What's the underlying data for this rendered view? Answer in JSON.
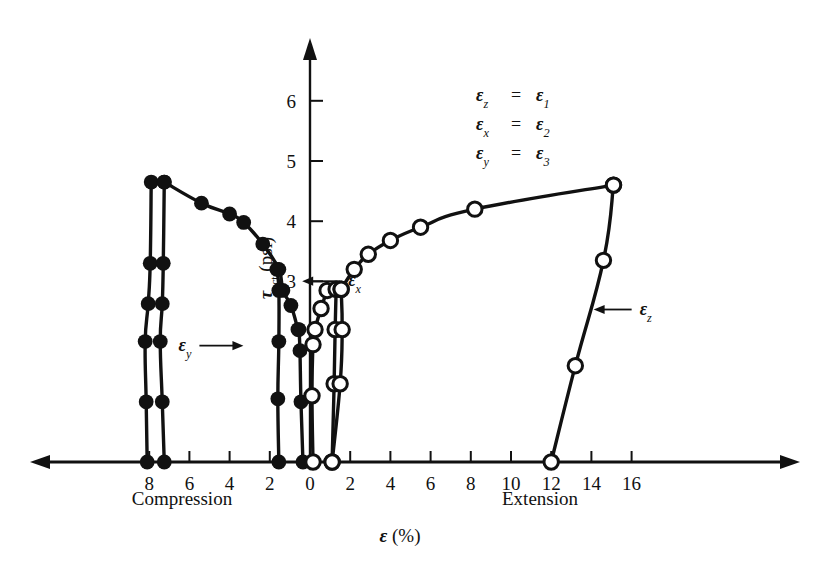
{
  "chart_data": {
    "type": "line",
    "title": "",
    "xlabel": "ε (%)",
    "ylabel": "τ_oct (psi)",
    "xlim": [
      -9.2,
      17.2
    ],
    "ylim": [
      0,
      6.7
    ],
    "grid": false,
    "axis_style": "double-arrow-horizontal-axis-with-central-vertical-axis",
    "x_ticks_left": [
      8,
      6,
      4,
      2,
      0
    ],
    "x_ticks_right": [
      0,
      2,
      4,
      6,
      8,
      10,
      12,
      14,
      16
    ],
    "x_tick_labels_left": [
      "8",
      "6",
      "4",
      "2",
      "0"
    ],
    "x_tick_labels_right": [
      "0",
      "2",
      "4",
      "6",
      "8",
      "10",
      "12",
      "14",
      "16"
    ],
    "y_ticks": [
      3,
      4,
      5,
      6
    ],
    "y_tick_labels": [
      "3",
      "4",
      "5",
      "6"
    ],
    "region_label_left": "Compression",
    "region_label_right": "Extension",
    "legend_lines": [
      {
        "lhs": "ε",
        "lhs_sub": "z",
        "rhs": "ε",
        "rhs_sub": "1"
      },
      {
        "lhs": "ε",
        "lhs_sub": "x",
        "rhs": "ε",
        "rhs_sub": "2"
      },
      {
        "lhs": "ε",
        "lhs_sub": "y",
        "rhs": "ε",
        "rhs_sub": "3"
      }
    ],
    "annotations": [
      {
        "name": "epsilon-x",
        "symbol": "ε",
        "sub": "x",
        "arrow": "left",
        "x_text": 1.9,
        "y_text": 2.92
      },
      {
        "name": "epsilon-y",
        "symbol": "ε",
        "sub": "y",
        "arrow": "right",
        "x_text": -5.9,
        "y_text": 1.85
      },
      {
        "name": "epsilon-z",
        "symbol": "ε",
        "sub": "z",
        "arrow": "left",
        "x_text": 16.4,
        "y_text": 2.45
      }
    ],
    "series": [
      {
        "name": "epsilon_y compression",
        "marker": "filled-circle",
        "side": "compression",
        "points": [
          [
            -8.1,
            0.0
          ],
          [
            -8.15,
            1.0
          ],
          [
            -8.2,
            2.0
          ],
          [
            -8.05,
            2.63
          ],
          [
            -7.95,
            3.3
          ],
          [
            -7.9,
            4.65
          ]
        ]
      },
      {
        "name": "epsilon_x compression",
        "marker": "filled-circle",
        "side": "compression",
        "points": [
          [
            -7.25,
            0.0
          ],
          [
            -7.35,
            1.0
          ],
          [
            -7.45,
            2.0
          ],
          [
            -7.35,
            2.63
          ],
          [
            -7.3,
            3.3
          ],
          [
            -7.25,
            4.65
          ]
        ]
      },
      {
        "name": "epsilon_z compression upper branch",
        "marker": "filled-circle",
        "side": "compression",
        "points": [
          [
            -7.25,
            4.65
          ],
          [
            -5.4,
            4.3
          ],
          [
            -4.0,
            4.12
          ],
          [
            -3.3,
            3.98
          ],
          [
            -2.35,
            3.62
          ],
          [
            -1.55,
            3.2
          ],
          [
            -1.35,
            2.85
          ],
          [
            -0.95,
            2.6
          ],
          [
            -0.6,
            2.2
          ]
        ]
      },
      {
        "name": "epsilon_x compression lower vertical",
        "marker": "filled-circle",
        "side": "compression",
        "points": [
          [
            -1.55,
            0.0
          ],
          [
            -1.6,
            1.05
          ],
          [
            -1.55,
            2.0
          ],
          [
            -1.55,
            2.85
          ],
          [
            -1.65,
            3.2
          ]
        ]
      },
      {
        "name": "epsilon_y compression inner vertical",
        "marker": "filled-circle",
        "side": "compression",
        "points": [
          [
            -0.35,
            0.0
          ],
          [
            -0.45,
            1.0
          ],
          [
            -0.5,
            1.85
          ],
          [
            -0.55,
            2.2
          ]
        ]
      },
      {
        "name": "epsilon_x extension inner",
        "marker": "open-circle",
        "side": "extension",
        "points": [
          [
            0.15,
            0.0
          ],
          [
            0.1,
            1.1
          ],
          [
            0.15,
            1.95
          ],
          [
            0.25,
            2.2
          ],
          [
            0.55,
            2.55
          ],
          [
            0.85,
            2.85
          ]
        ]
      },
      {
        "name": "epsilon_y extension",
        "marker": "open-circle",
        "side": "extension",
        "points": [
          [
            1.1,
            0.0
          ],
          [
            1.2,
            1.3
          ],
          [
            1.25,
            2.2
          ],
          [
            1.3,
            2.87
          ]
        ]
      },
      {
        "name": "epsilon_y extension outer",
        "marker": "open-circle",
        "side": "extension",
        "points": [
          [
            1.1,
            0.0
          ],
          [
            1.5,
            1.3
          ],
          [
            1.6,
            2.2
          ],
          [
            1.55,
            2.87
          ]
        ]
      },
      {
        "name": "epsilon_z extension upper",
        "marker": "open-circle",
        "side": "extension",
        "points": [
          [
            1.55,
            2.87
          ],
          [
            2.2,
            3.2
          ],
          [
            2.9,
            3.45
          ],
          [
            4.0,
            3.68
          ],
          [
            5.5,
            3.9
          ],
          [
            8.2,
            4.2
          ],
          [
            15.1,
            4.6
          ]
        ]
      },
      {
        "name": "epsilon_z extension right",
        "marker": "open-circle",
        "side": "extension",
        "points": [
          [
            12.0,
            0.0
          ],
          [
            13.2,
            1.6
          ],
          [
            14.6,
            3.35
          ],
          [
            15.1,
            4.6
          ]
        ]
      }
    ]
  }
}
